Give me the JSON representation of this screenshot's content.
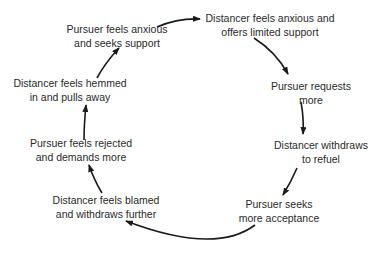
{
  "diagram": {
    "type": "cycle",
    "direction": "clockwise",
    "nodes": [
      {
        "id": "n1",
        "line1": "Pursuer feels anxious",
        "line2": "and seeks support"
      },
      {
        "id": "n2",
        "line1": "Distancer feels anxious and",
        "line2": "offers limited support"
      },
      {
        "id": "n3",
        "line1": "Pursuer requests",
        "line2": "more"
      },
      {
        "id": "n4",
        "line1": "Distancer withdraws",
        "line2": "to refuel"
      },
      {
        "id": "n5",
        "line1": "Pursuer seeks",
        "line2": "more acceptance"
      },
      {
        "id": "n6",
        "line1": "Distancer feels blamed",
        "line2": "and withdraws further"
      },
      {
        "id": "n7",
        "line1": "Pursuer feels rejected",
        "line2": "and demands more"
      },
      {
        "id": "n8",
        "line1": "Distancer feels hemmed",
        "line2": "in and pulls away"
      }
    ],
    "edges": [
      {
        "from": "n1",
        "to": "n2"
      },
      {
        "from": "n2",
        "to": "n3"
      },
      {
        "from": "n3",
        "to": "n4"
      },
      {
        "from": "n4",
        "to": "n5"
      },
      {
        "from": "n5",
        "to": "n6"
      },
      {
        "from": "n6",
        "to": "n7"
      },
      {
        "from": "n7",
        "to": "n8"
      },
      {
        "from": "n8",
        "to": "n1"
      }
    ],
    "colors": {
      "text": "#2a2a2a",
      "arrow": "#1a1a1a",
      "background": "#ffffff"
    }
  }
}
